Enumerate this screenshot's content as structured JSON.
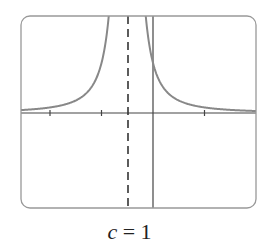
{
  "chart_data": {
    "type": "line",
    "title": "",
    "caption": {
      "variable": "c",
      "equals": "=",
      "value": "1"
    },
    "xlabel": "",
    "ylabel": "",
    "function": "y = c / (x + 0.5)^2",
    "parameter_c": 1,
    "xlim": [
      -2.6,
      2.0
    ],
    "ylim": [
      -1.9,
      1.9
    ],
    "x_ticks": [
      -2,
      -1,
      1
    ],
    "grid": false,
    "legend": null,
    "vertical_asymptote": {
      "x": -0.5,
      "style": "dashed"
    },
    "horizontal_asymptote": {
      "y": 0
    },
    "series": [
      {
        "name": "left branch",
        "x": [
          -2.6,
          -2.0,
          -1.5,
          -1.2,
          -1.0,
          -0.9,
          -0.8,
          -0.75
        ],
        "y": [
          0.23,
          0.44,
          1.0,
          2.04,
          4.0,
          6.25,
          11.1,
          16.0
        ]
      },
      {
        "name": "right branch",
        "x": [
          -0.2,
          -0.1,
          0.0,
          0.2,
          0.5,
          1.0,
          1.5,
          2.0
        ],
        "y": [
          11.1,
          6.25,
          4.0,
          2.04,
          1.0,
          0.44,
          0.25,
          0.16
        ]
      }
    ],
    "colors": {
      "curve": "#888888",
      "axes": "#444444",
      "frame": "#999999",
      "asymptote": "#333333"
    }
  }
}
